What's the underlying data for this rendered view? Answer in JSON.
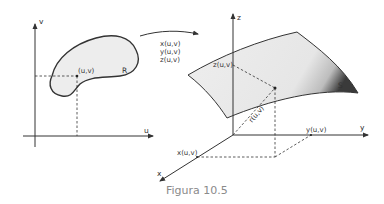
{
  "figure": {
    "caption": "Figura 10.5",
    "parameter_plane": {
      "axis_u_label": "u",
      "axis_v_label": "v",
      "point_label": "(u,v)",
      "region_label": "R"
    },
    "mapping": {
      "line1": "x(u,v)",
      "line2": "y(u,v)",
      "line3": "z(u,v)"
    },
    "space": {
      "axis_x_label": "x",
      "axis_y_label": "y",
      "axis_z_label": "z",
      "x_component_label": "x(u,v)",
      "y_component_label": "y(u,v)",
      "z_component_label": "z(u,v)",
      "vector_label": "r(u,v)",
      "surface_label": "S"
    },
    "colors": {
      "line": "#333333",
      "fill": "#ececec",
      "caption": "#8a8a8a"
    }
  }
}
